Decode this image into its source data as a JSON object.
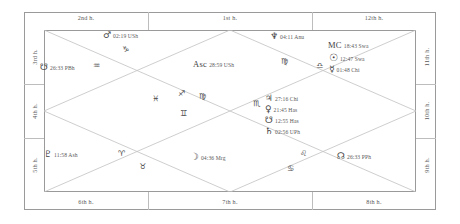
{
  "chart": {
    "style": "north-indian-rectangular",
    "colors": {
      "border": "#9a9a9a",
      "grid": "#c2c2c2",
      "text": "#4a4a4a",
      "glyph": "#3f3f3f"
    }
  },
  "houses": {
    "top": [
      {
        "label": "2nd h."
      },
      {
        "label": "1st h."
      },
      {
        "label": "12th h."
      }
    ],
    "bottom": [
      {
        "label": "6th h."
      },
      {
        "label": "7th h."
      },
      {
        "label": "8th h."
      }
    ],
    "left": [
      {
        "label": "3rd h."
      },
      {
        "label": "4th h."
      },
      {
        "label": "5th h."
      }
    ],
    "right": [
      {
        "label": "11th h."
      },
      {
        "label": "10th h."
      },
      {
        "label": "9th h."
      }
    ]
  },
  "placements": [
    {
      "name": "mars",
      "glyph": "♂",
      "degree": "02:19",
      "nakshatra": "USh",
      "text": "02:19 USh"
    },
    {
      "name": "ketu-node",
      "glyph": "☋",
      "degree": "26:33",
      "nakshatra": "PBh",
      "text": "26:33 PBh"
    },
    {
      "name": "ascendant",
      "glyph": "Asc",
      "degree": "28:59",
      "nakshatra": "USh",
      "text": "28:59 USh"
    },
    {
      "name": "neptune",
      "glyph": "♆",
      "degree": "04:11",
      "nakshatra": "Anu",
      "text": "04:11 Anu"
    },
    {
      "name": "midheaven",
      "glyph": "MC",
      "degree": "18:43",
      "nakshatra": "Swa",
      "text": "18:43 Swa"
    },
    {
      "name": "sun",
      "glyph": "☉",
      "degree": "12:47",
      "nakshatra": "Swa",
      "text": "12:47 Swa"
    },
    {
      "name": "mercury",
      "glyph": "☿",
      "degree": "01:48",
      "nakshatra": "Chi",
      "text": "01:48 Chi"
    },
    {
      "name": "jupiter",
      "glyph": "♃",
      "degree": "27:16",
      "nakshatra": "Chi",
      "text": "27:16 Chi"
    },
    {
      "name": "venus",
      "glyph": "♀",
      "degree": "21:45",
      "nakshatra": "Has",
      "text": "21:45 Has"
    },
    {
      "name": "ketu",
      "glyph": "☋",
      "degree": "12:55",
      "nakshatra": "Has",
      "text": "12:55 Has"
    },
    {
      "name": "saturn",
      "glyph": "♄",
      "degree": "02:56",
      "nakshatra": "UPh",
      "text": "02:56 UPh"
    },
    {
      "name": "pluto",
      "glyph": "♇",
      "degree": "11:58",
      "nakshatra": "Ash",
      "text": "11:58 Ash"
    },
    {
      "name": "moon",
      "glyph": "☽",
      "degree": "04:36",
      "nakshatra": "Mrg",
      "text": "04:36 Mrg"
    },
    {
      "name": "rahu",
      "glyph": "☊",
      "degree": "26:33",
      "nakshatra": "PPh",
      "text": "26:33 PPh"
    }
  ],
  "signs": [
    {
      "name": "capricorn",
      "glyph": "♑"
    },
    {
      "name": "aquarius",
      "glyph": "♒"
    },
    {
      "name": "scorpio",
      "glyph": "♏"
    },
    {
      "name": "virgo",
      "glyph": "♍"
    },
    {
      "name": "sagittarius",
      "glyph": "♐"
    },
    {
      "name": "pisces",
      "glyph": "♓"
    },
    {
      "name": "gemini",
      "glyph": "♊"
    },
    {
      "name": "libra",
      "glyph": "♎"
    },
    {
      "name": "aries",
      "glyph": "♈"
    },
    {
      "name": "taurus",
      "glyph": "♉"
    },
    {
      "name": "leo",
      "glyph": "♌"
    },
    {
      "name": "cancer",
      "glyph": "♋"
    }
  ]
}
